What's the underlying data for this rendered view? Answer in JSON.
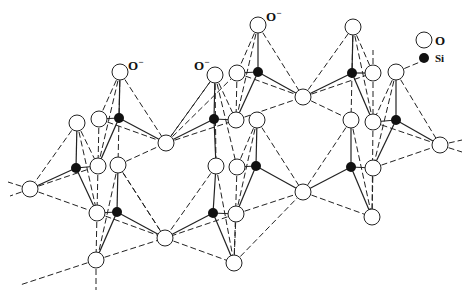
{
  "legend": {
    "items": [
      {
        "symbol": "open-circle",
        "label": "O"
      },
      {
        "symbol": "filled-circle",
        "label": "Si"
      }
    ]
  },
  "colors": {
    "line": "#222222",
    "oxygen_fill": "#ffffff",
    "silicon_fill": "#111111"
  },
  "charge_labels": [
    {
      "text": "O",
      "sup": "−",
      "x": 128,
      "y": 70
    },
    {
      "text": "O",
      "sup": "−",
      "x": 194,
      "y": 70
    },
    {
      "text": "O",
      "sup": "−",
      "x": 266,
      "y": 21
    }
  ],
  "oxygens": [
    [
      120,
      72
    ],
    [
      99,
      119
    ],
    [
      166,
      143
    ],
    [
      77,
      123
    ],
    [
      98,
      166
    ],
    [
      118,
      165
    ],
    [
      30,
      189
    ],
    [
      97,
      213
    ],
    [
      165,
      238
    ],
    [
      96,
      260
    ],
    [
      215,
      75
    ],
    [
      237,
      73
    ],
    [
      258,
      25
    ],
    [
      303,
      97
    ],
    [
      236,
      120
    ],
    [
      257,
      120
    ],
    [
      216,
      166
    ],
    [
      237,
      167
    ],
    [
      236,
      214
    ],
    [
      234,
      263
    ],
    [
      303,
      192
    ],
    [
      353,
      27
    ],
    [
      373,
      73
    ],
    [
      396,
      72
    ],
    [
      351,
      120
    ],
    [
      373,
      122
    ],
    [
      440,
      145
    ],
    [
      373,
      168
    ],
    [
      372,
      217
    ]
  ],
  "silicons": [
    [
      119,
      118
    ],
    [
      76,
      168
    ],
    [
      117,
      212
    ],
    [
      214,
      119
    ],
    [
      258,
      72
    ],
    [
      256,
      166
    ],
    [
      213,
      213
    ],
    [
      352,
      73
    ],
    [
      396,
      120
    ],
    [
      351,
      167
    ]
  ]
}
